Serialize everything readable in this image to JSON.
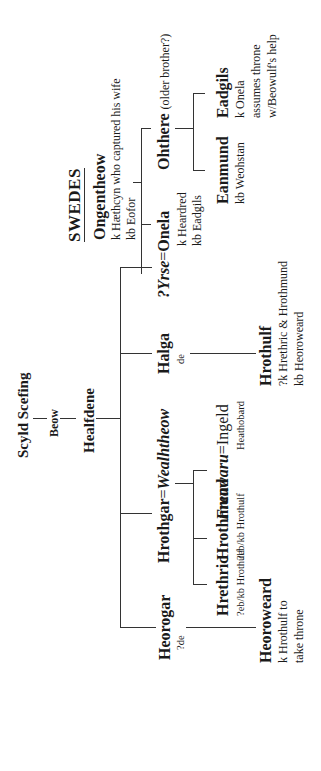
{
  "root": {
    "scyld": "Scyld Scefing",
    "beow": "Beow",
    "healfdene": "Healfdene"
  },
  "danes": {
    "heorogar": {
      "name": "Heorogar",
      "note": "?de"
    },
    "heoroweard": {
      "name": "Heoroweard",
      "notes": [
        "k Hrothulf to",
        "take throne"
      ]
    },
    "hrothgar": {
      "name": "Hrothgar",
      "eq": "=",
      "spouse": "Wealhtheow"
    },
    "hrethric": {
      "name": "Hrethric",
      "note": "?eb/kb Hrothulf"
    },
    "hrothmund": {
      "name": "Hrothmund",
      "note": "?eb/kb Hrothulf"
    },
    "freawaru": {
      "name": "Freawaru",
      "eq": "=",
      "spouse": "Ingeld",
      "note": "Heathobard"
    },
    "halga": {
      "name": "Halga",
      "note": "de"
    },
    "hrothulf": {
      "name": "Hrothulf",
      "notes": [
        "?k Hrethric & Hrothmund",
        "kb Heoroweard"
      ]
    },
    "yrse": {
      "name": "?Yrse",
      "eq": "=",
      "spouse": "Onela",
      "notes": [
        "k Heardred",
        "kb Eadgils"
      ]
    }
  },
  "swedes": {
    "title": "SWEDES",
    "ongentheow": {
      "name": "Ongentheow",
      "notes": [
        "k Hæthcyn who captured his wife",
        "kb Eofor"
      ]
    },
    "ohthere": {
      "name": "Ohthere",
      "note": "(older brother?)"
    },
    "eanmund": {
      "name": "Eanmund",
      "note": "kb Weohstan"
    },
    "eadgils": {
      "name": "Eadgils",
      "notes": [
        "k Onela",
        "assumes throne",
        "w/Beowulf's help"
      ]
    }
  }
}
